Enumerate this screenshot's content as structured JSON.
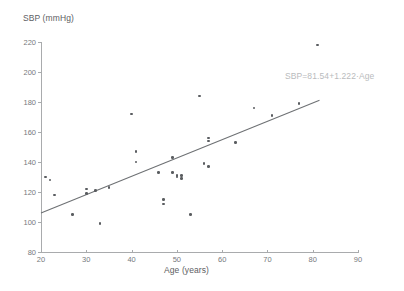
{
  "chart_data": {
    "type": "scatter",
    "title": "",
    "xlabel": "Age (years)",
    "ylabel": "SBP (mmHg)",
    "xlim": [
      20,
      90
    ],
    "ylim": [
      80,
      220
    ],
    "xticks": [
      20,
      30,
      40,
      50,
      60,
      70,
      80,
      90
    ],
    "yticks": [
      80,
      100,
      120,
      140,
      160,
      180,
      200,
      220
    ],
    "grid": false,
    "legend": "none",
    "annotations": [
      {
        "name": "regression-equation",
        "text": "SBP=81.54+1.222·Age",
        "x": 68,
        "y": 190
      }
    ],
    "series": [
      {
        "name": "observations",
        "type": "scatter",
        "marker_color": "#5a5d60",
        "points": [
          {
            "x": 21,
            "y": 130
          },
          {
            "x": 22,
            "y": 128
          },
          {
            "x": 23,
            "y": 118
          },
          {
            "x": 27,
            "y": 105
          },
          {
            "x": 30,
            "y": 122
          },
          {
            "x": 30,
            "y": 119
          },
          {
            "x": 32,
            "y": 121
          },
          {
            "x": 33,
            "y": 99
          },
          {
            "x": 35,
            "y": 123
          },
          {
            "x": 40,
            "y": 172
          },
          {
            "x": 41,
            "y": 147
          },
          {
            "x": 41,
            "y": 140
          },
          {
            "x": 46,
            "y": 133
          },
          {
            "x": 47,
            "y": 112
          },
          {
            "x": 47,
            "y": 115
          },
          {
            "x": 49,
            "y": 143
          },
          {
            "x": 49,
            "y": 133
          },
          {
            "x": 50,
            "y": 131
          },
          {
            "x": 50,
            "y": 130
          },
          {
            "x": 51,
            "y": 131
          },
          {
            "x": 51,
            "y": 129
          },
          {
            "x": 53,
            "y": 105
          },
          {
            "x": 55,
            "y": 184
          },
          {
            "x": 56,
            "y": 139
          },
          {
            "x": 57,
            "y": 137
          },
          {
            "x": 57,
            "y": 156
          },
          {
            "x": 57,
            "y": 154
          },
          {
            "x": 63,
            "y": 153
          },
          {
            "x": 67,
            "y": 176
          },
          {
            "x": 71,
            "y": 171
          },
          {
            "x": 77,
            "y": 179
          },
          {
            "x": 81,
            "y": 218
          }
        ]
      },
      {
        "name": "regression-line",
        "type": "line",
        "line_color": "#6e7174",
        "intercept": 81.54,
        "slope": 1.222,
        "x_start": 20,
        "x_end": 81.5
      }
    ]
  },
  "axes": {
    "y_title": "SBP (mmHg)",
    "x_title": "Age (years)",
    "y_tick_labels": [
      "220",
      "200",
      "180",
      "160",
      "140",
      "120",
      "100",
      "80"
    ],
    "x_tick_labels": [
      "20",
      "30",
      "40",
      "50",
      "60",
      "70",
      "80",
      "90"
    ]
  },
  "colors": {
    "marker": "#5a5d60",
    "line": "#6e7174",
    "axis": "#a9abad",
    "text": "#76797c",
    "annotation": "#b9bbbd",
    "background": "#ffffff"
  }
}
